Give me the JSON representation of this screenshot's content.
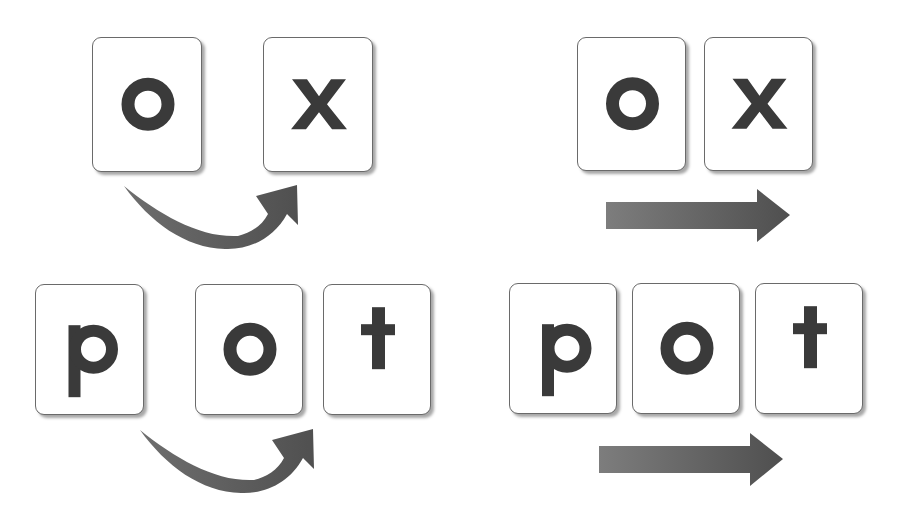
{
  "figure": {
    "glyph_color": "#3a3a3a",
    "card_border_color": "#6a6a6a",
    "arrow_color_dark": "#4f4f4f",
    "arrow_color_light": "#7d7d7d"
  },
  "panels": [
    {
      "id": "top-left",
      "word": "ox",
      "arrow_type": "curved",
      "cards": [
        {
          "letter": "o",
          "x": 92,
          "y": 37,
          "w": 110,
          "h": 135
        },
        {
          "letter": "x",
          "x": 263,
          "y": 37,
          "w": 110,
          "h": 135
        }
      ],
      "arrow": {
        "icon": "curved-arrow-icon",
        "dx": 0,
        "dy": 0
      }
    },
    {
      "id": "top-right",
      "word": "ox",
      "arrow_type": "straight",
      "cards": [
        {
          "letter": "o",
          "x": 577,
          "y": 37,
          "w": 109,
          "h": 134
        },
        {
          "letter": "x",
          "x": 704,
          "y": 37,
          "w": 109,
          "h": 134
        }
      ],
      "arrow": {
        "icon": "straight-arrow-icon",
        "x": 606,
        "y": 189
      }
    },
    {
      "id": "bottom-left",
      "word": "pot",
      "arrow_type": "curved",
      "cards": [
        {
          "letter": "p",
          "x": 35,
          "y": 284,
          "w": 109,
          "h": 131
        },
        {
          "letter": "o",
          "x": 195,
          "y": 284,
          "w": 108,
          "h": 131
        },
        {
          "letter": "t",
          "x": 323,
          "y": 284,
          "w": 108,
          "h": 131
        }
      ],
      "arrow": {
        "icon": "curved-arrow-icon",
        "dx": 16,
        "dy": 244
      }
    },
    {
      "id": "bottom-right",
      "word": "pot",
      "arrow_type": "straight",
      "cards": [
        {
          "letter": "p",
          "x": 509,
          "y": 283,
          "w": 108,
          "h": 131
        },
        {
          "letter": "o",
          "x": 632,
          "y": 283,
          "w": 108,
          "h": 131
        },
        {
          "letter": "t",
          "x": 755,
          "y": 283,
          "w": 108,
          "h": 131
        }
      ],
      "arrow": {
        "icon": "straight-arrow-icon",
        "x": 599,
        "y": 433
      }
    }
  ]
}
